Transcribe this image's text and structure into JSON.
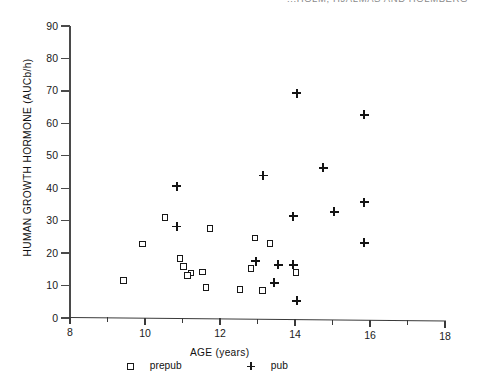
{
  "running_head": "...HOLM, HJALMAS AND HOLMBERG",
  "chart_data": {
    "type": "scatter",
    "title": "",
    "xlabel": "AGE  (years)",
    "ylabel": "HUMAN  GROWTH  HORMONE  (AUCb/h)",
    "xlim": [
      8,
      18
    ],
    "ylim": [
      0,
      90
    ],
    "xticks": [
      8,
      9,
      10,
      11,
      12,
      13,
      14,
      15,
      16,
      17,
      18
    ],
    "xtick_labels": [
      "8",
      "",
      "10",
      "",
      "12",
      "",
      "14",
      "",
      "16",
      "",
      "18"
    ],
    "xtick_major": [
      8,
      10,
      12,
      14,
      16,
      18
    ],
    "yticks": [
      0,
      10,
      20,
      30,
      40,
      50,
      60,
      70,
      80,
      90
    ],
    "ytick_labels": [
      "0",
      "10",
      "20",
      "30",
      "40",
      "50",
      "60",
      "70",
      "80",
      "90"
    ],
    "grid": false,
    "legend_position": "below-axis",
    "series": [
      {
        "name": "prepub",
        "marker": "open-square",
        "points": [
          [
            9.45,
            11.5
          ],
          [
            9.95,
            22.8
          ],
          [
            10.55,
            31.0
          ],
          [
            10.95,
            18.5
          ],
          [
            11.05,
            16.0
          ],
          [
            11.25,
            14.0
          ],
          [
            11.15,
            13.2
          ],
          [
            11.55,
            14.3
          ],
          [
            11.65,
            9.5
          ],
          [
            11.75,
            27.8
          ],
          [
            12.55,
            9.0
          ],
          [
            12.85,
            15.5
          ],
          [
            12.95,
            25.0
          ],
          [
            13.15,
            8.8
          ],
          [
            13.35,
            23.3
          ],
          [
            14.05,
            14.5
          ]
        ]
      },
      {
        "name": "pub",
        "marker": "plus",
        "points": [
          [
            10.85,
            41.0
          ],
          [
            10.85,
            28.5
          ],
          [
            12.95,
            18.0
          ],
          [
            13.15,
            44.5
          ],
          [
            13.45,
            11.5
          ],
          [
            13.55,
            17.0
          ],
          [
            13.95,
            32.0
          ],
          [
            13.95,
            17.0
          ],
          [
            14.05,
            70.0
          ],
          [
            14.05,
            6.0
          ],
          [
            14.75,
            47.0
          ],
          [
            15.05,
            33.5
          ],
          [
            15.85,
            36.5
          ],
          [
            15.85,
            63.5
          ],
          [
            15.85,
            24.0
          ]
        ]
      }
    ]
  },
  "legend": {
    "prepub_label": "prepub",
    "pub_label": "pub"
  }
}
